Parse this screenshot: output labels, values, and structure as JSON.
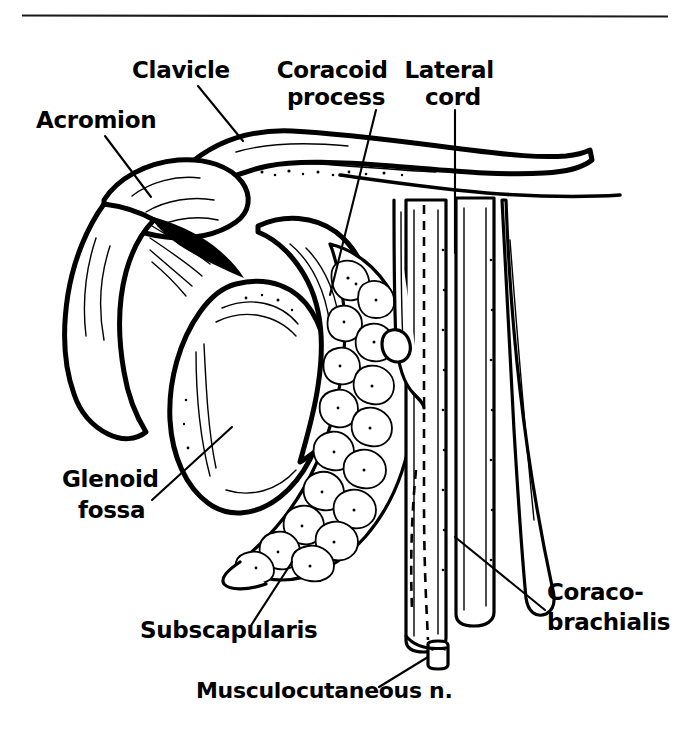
{
  "figure": {
    "top_rule": "horizontal-rule",
    "background_color": "#ffffff",
    "ink_color": "#000000"
  },
  "labels": [
    {
      "id": "acromion",
      "text": "Acromion",
      "lines": [
        "Acromion"
      ],
      "x": 36,
      "y": 128,
      "anchor": "start"
    },
    {
      "id": "clavicle",
      "text": "Clavicle",
      "lines": [
        "Clavicle"
      ],
      "x": 132,
      "y": 78,
      "anchor": "start"
    },
    {
      "id": "coracoid-process",
      "text": "Coracoid process",
      "lines": [
        "Coracoid",
        "process"
      ],
      "x": 336,
      "y": 78,
      "anchor": "middle"
    },
    {
      "id": "lateral-cord",
      "text": "Lateral cord",
      "lines": [
        "Lateral",
        "cord"
      ],
      "x": 453,
      "y": 78,
      "anchor": "middle"
    },
    {
      "id": "glenoid-fossa",
      "text": "Glenoid fossa",
      "lines": [
        "Glenoid",
        "fossa"
      ],
      "x": 62,
      "y": 487,
      "anchor": "start"
    },
    {
      "id": "subscapularis",
      "text": "Subscapularis",
      "lines": [
        "Subscapularis"
      ],
      "x": 140,
      "y": 638,
      "anchor": "start"
    },
    {
      "id": "musculocutaneous-n",
      "text": "Musculocutaneous n.",
      "lines": [
        "Musculocutaneous n."
      ],
      "x": 196,
      "y": 698,
      "anchor": "start"
    },
    {
      "id": "coraco-brachialis",
      "text": "Coraco-brachialis",
      "lines": [
        "Coraco-",
        "brachialis"
      ],
      "x": 547,
      "y": 600,
      "anchor": "start"
    }
  ],
  "leaders": [
    {
      "id": "leader-acromion",
      "points": "105,136 151,197"
    },
    {
      "id": "leader-clavicle",
      "points": "198,86 243,141"
    },
    {
      "id": "leader-coracoid-process",
      "points": "376,110 330,295"
    },
    {
      "id": "leader-lateral-cord",
      "points": "455,110 455,253"
    },
    {
      "id": "leader-glenoid-fossa",
      "points": "152,500 232,427"
    },
    {
      "id": "leader-subscapularis",
      "points": "250,627 292,562"
    },
    {
      "id": "leader-musculocutaneous",
      "points": "379,687 428,657"
    },
    {
      "id": "leader-coraco-brachialis",
      "points": "545,610 455,537"
    }
  ],
  "rule": {
    "x1": 22,
    "y1": 15,
    "x2": 668,
    "y2": 16
  }
}
